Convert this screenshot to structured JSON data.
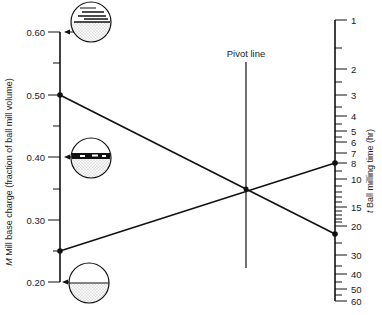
{
  "diagram": {
    "type": "nomograph",
    "pivot_label": "Pivot line",
    "left_axis": {
      "label": "M Mill base charge (fraction of ball mill volume)",
      "label_italic_prefix": "M",
      "label_rest": " Mill base charge (fraction of ball mill volume)",
      "ticks": [
        {
          "value": 0.6,
          "label": "0.60",
          "y": 32
        },
        {
          "value": 0.55,
          "label": "",
          "y": 63
        },
        {
          "value": 0.5,
          "label": "0.50",
          "y": 95
        },
        {
          "value": 0.45,
          "label": "",
          "y": 126
        },
        {
          "value": 0.4,
          "label": "0.40",
          "y": 157
        },
        {
          "value": 0.35,
          "label": "",
          "y": 189
        },
        {
          "value": 0.3,
          "label": "0.30",
          "y": 220
        },
        {
          "value": 0.25,
          "label": "",
          "y": 251
        },
        {
          "value": 0.2,
          "label": "0.20",
          "y": 282
        }
      ]
    },
    "right_axis": {
      "label_italic_prefix": "t",
      "label_rest": " Ball milling time (hr)",
      "major_ticks": [
        {
          "label": "1",
          "y": 20
        },
        {
          "label": "2",
          "y": 69
        },
        {
          "label": "3",
          "y": 95
        },
        {
          "label": "4",
          "y": 116
        },
        {
          "label": "5",
          "y": 131
        },
        {
          "label": "6",
          "y": 142
        },
        {
          "label": "7",
          "y": 153
        },
        {
          "label": "8",
          "y": 163
        },
        {
          "label": "10",
          "y": 179
        },
        {
          "label": "15",
          "y": 207
        },
        {
          "label": "20",
          "y": 226
        },
        {
          "label": "30",
          "y": 255
        },
        {
          "label": "40",
          "y": 274
        },
        {
          "label": "50",
          "y": 289
        },
        {
          "label": "60",
          "y": 301
        }
      ],
      "minor_ticks_y": [
        48,
        82,
        107,
        124,
        137,
        171,
        186,
        192,
        197,
        202,
        211,
        215,
        219,
        222,
        243,
        266,
        282,
        295
      ]
    },
    "example_lines": [
      {
        "from_value": "0.50",
        "to_value": "22",
        "from_y": 95,
        "to_y": 234
      },
      {
        "from_value": "0.25",
        "to_value": "8",
        "from_y": 251,
        "to_y": 163
      }
    ],
    "mill_illustrations": [
      {
        "level": "0.60",
        "description": "mill cross-section: overfilled, balls and mill base above"
      },
      {
        "level": "0.40",
        "description": "mill cross-section: balls just covered"
      },
      {
        "level": "0.20",
        "description": "mill cross-section: mill base only at bottom"
      }
    ]
  }
}
